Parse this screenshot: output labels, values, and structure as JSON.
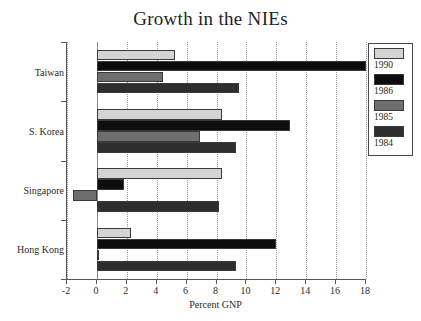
{
  "chart_data": {
    "type": "bar",
    "orientation": "horizontal",
    "title": "Growth in the NIEs",
    "xlabel": "Percent GNP",
    "ylabel": "",
    "xlim": [
      -2,
      18
    ],
    "xticks": [
      -2,
      0,
      2,
      4,
      6,
      8,
      10,
      12,
      14,
      16,
      18
    ],
    "xtick_labels": [
      "-2",
      "0",
      "2",
      "4",
      "6",
      "8",
      "10",
      "12",
      "14",
      "16",
      "18"
    ],
    "grid": "vertical-dotted",
    "legend_position": "right-outside",
    "categories": [
      "Taiwan",
      "S. Korea",
      "Singapore",
      "Hong Kong"
    ],
    "series": [
      {
        "name": "1990",
        "color": "#d4d4d4",
        "values": [
          5.2,
          8.4,
          8.4,
          2.3
        ]
      },
      {
        "name": "1986",
        "color": "#0d0d0d",
        "values": [
          18.0,
          12.9,
          1.8,
          12.0
        ]
      },
      {
        "name": "1985",
        "color": "#6e6e6e",
        "values": [
          4.4,
          6.9,
          -1.6,
          0.05
        ]
      },
      {
        "name": "1984",
        "color": "#2e2e2e",
        "values": [
          9.5,
          9.3,
          8.2,
          9.3
        ]
      }
    ]
  },
  "legend": {
    "entries": [
      {
        "label": "1990",
        "color": "#d4d4d4"
      },
      {
        "label": "1986",
        "color": "#0d0d0d"
      },
      {
        "label": "1985",
        "color": "#6e6e6e"
      },
      {
        "label": "1984",
        "color": "#2e2e2e"
      }
    ]
  },
  "colors": {
    "axis": "#55585e",
    "grid": "#9a9a9a",
    "text": "#1f1f1f",
    "background": "#ffffff"
  }
}
